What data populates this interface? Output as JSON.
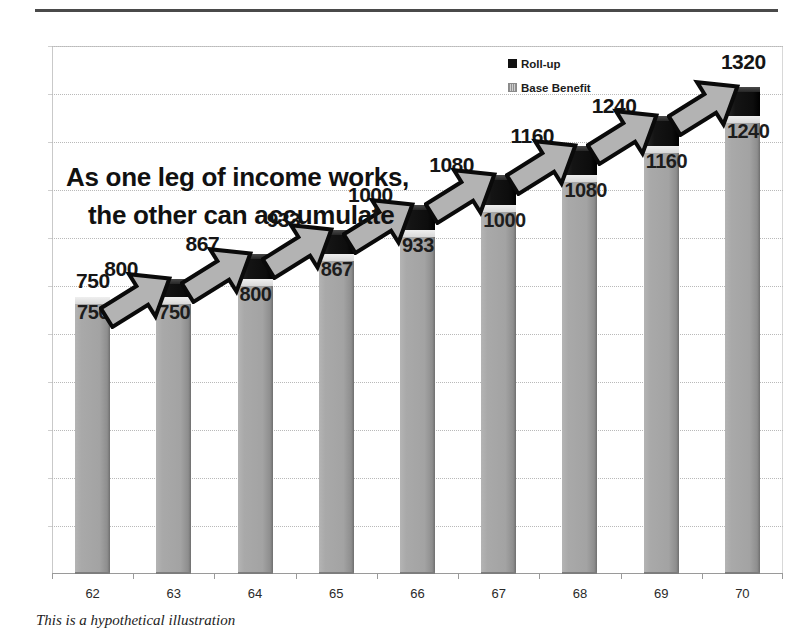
{
  "top_rule": "horizontal-rule",
  "callout": {
    "line1": "As one leg of income works,",
    "line2": "the other can accumulate"
  },
  "legend": {
    "position": "top-right-inside",
    "items": [
      {
        "label": "Roll-up",
        "color": "#111111",
        "key": "rollup"
      },
      {
        "label": "Base Benefit",
        "color": "#b0b0b0",
        "key": "base"
      }
    ]
  },
  "footnote": "This is a hypothetical illustration",
  "colors": {
    "base_benefit": "#a8a8a8",
    "roll_up": "#111111",
    "gridline": "#b9b9b9",
    "rule": "#4a4a4a",
    "text": "#1d1d1d"
  },
  "chart_data": {
    "type": "bar",
    "subtype": "stacked",
    "title": "As one leg of income works, the other can accumulate",
    "xlabel": "",
    "ylabel": "",
    "grid": true,
    "legend_position": "top-right",
    "ylim": [
      0,
      1430
    ],
    "categories": [
      "62",
      "63",
      "64",
      "65",
      "66",
      "67",
      "68",
      "69",
      "70"
    ],
    "series": [
      {
        "name": "Base Benefit",
        "color": "#a8a8a8",
        "values": [
          750,
          750,
          800,
          867,
          933,
          1000,
          1080,
          1160,
          1240
        ]
      },
      {
        "name": "Roll-up",
        "color": "#111111",
        "values": [
          0,
          50,
          67,
          66,
          67,
          80,
          80,
          80,
          80
        ]
      }
    ],
    "base_labels": [
      "750",
      "750",
      "800",
      "867",
      "933",
      "1000",
      "1080",
      "1160",
      "1240"
    ],
    "total_labels": [
      "750",
      "800",
      "867",
      "933",
      "1000",
      "1080",
      "1160",
      "1240",
      "1320"
    ],
    "totals": [
      750,
      800,
      867,
      933,
      1000,
      1080,
      1160,
      1240,
      1320
    ],
    "annotations": [
      {
        "type": "arrow",
        "from_category": "62",
        "to_category": "63",
        "style": "block-arrow-up-right"
      },
      {
        "type": "arrow",
        "from_category": "63",
        "to_category": "64",
        "style": "block-arrow-up-right"
      },
      {
        "type": "arrow",
        "from_category": "64",
        "to_category": "65",
        "style": "block-arrow-up-right"
      },
      {
        "type": "arrow",
        "from_category": "65",
        "to_category": "66",
        "style": "block-arrow-up-right"
      },
      {
        "type": "arrow",
        "from_category": "66",
        "to_category": "67",
        "style": "block-arrow-up-right"
      },
      {
        "type": "arrow",
        "from_category": "67",
        "to_category": "68",
        "style": "block-arrow-up-right"
      },
      {
        "type": "arrow",
        "from_category": "68",
        "to_category": "69",
        "style": "block-arrow-up-right"
      },
      {
        "type": "arrow",
        "from_category": "69",
        "to_category": "70",
        "style": "block-arrow-up-right"
      }
    ]
  }
}
